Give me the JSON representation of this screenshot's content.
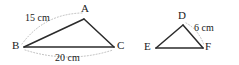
{
  "figure": {
    "type": "geometry-diagram",
    "stroke_color": "#2b2b2b",
    "arc_color": "#b5b5b5",
    "background": "#ffffff",
    "width": 239,
    "height": 65
  },
  "triangle_left": {
    "vertices": [
      {
        "name": "A",
        "label": "A",
        "x": 84,
        "y": 19
      },
      {
        "name": "B",
        "label": "B",
        "x": 24,
        "y": 47
      },
      {
        "name": "C",
        "label": "C",
        "x": 114,
        "y": 47
      }
    ],
    "side_labels": [
      {
        "name": "AB",
        "label": "15 cm",
        "value": 15,
        "unit": "cm"
      },
      {
        "name": "BC",
        "label": "20 cm",
        "value": 20,
        "unit": "cm"
      }
    ]
  },
  "triangle_right": {
    "vertices": [
      {
        "name": "D",
        "label": "D",
        "x": 183,
        "y": 25
      },
      {
        "name": "E",
        "label": "E",
        "x": 156,
        "y": 48
      },
      {
        "name": "F",
        "label": "F",
        "x": 203,
        "y": 48
      }
    ],
    "side_labels": [
      {
        "name": "DF",
        "label": "6 cm",
        "value": 6,
        "unit": "cm"
      }
    ]
  }
}
